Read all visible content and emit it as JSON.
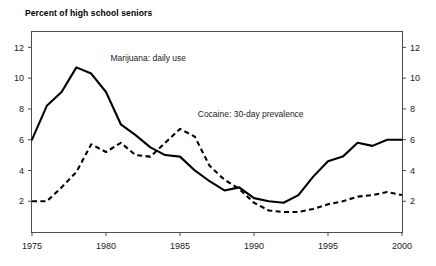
{
  "chart_data": {
    "type": "line",
    "title": "Percent of high school seniors",
    "xlabel": "",
    "ylabel": "",
    "xlim": [
      1975,
      2000
    ],
    "ylim": [
      0,
      13
    ],
    "grid": false,
    "legend_position": "inline-annotation",
    "x_ticks": [
      "1975",
      "1980",
      "1985",
      "1990",
      "1995",
      "2000"
    ],
    "x_tick_values": [
      1975,
      1980,
      1985,
      1990,
      1995,
      2000
    ],
    "y_ticks": [
      "2",
      "4",
      "6",
      "8",
      "10",
      "12"
    ],
    "y_tick_values": [
      2,
      4,
      6,
      8,
      10,
      12
    ],
    "y_ticks_right": [
      "2",
      "4",
      "6",
      "8",
      "10",
      "12"
    ],
    "x": [
      1975,
      1976,
      1977,
      1978,
      1979,
      1980,
      1981,
      1982,
      1983,
      1984,
      1985,
      1986,
      1987,
      1988,
      1989,
      1990,
      1991,
      1992,
      1993,
      1994,
      1995,
      1996,
      1997,
      1998,
      1999,
      2000
    ],
    "series": [
      {
        "name": "Marijuana: daily use",
        "style": "solid",
        "label_x": 1980.3,
        "label_y": 11.1,
        "values": [
          6.0,
          8.2,
          9.1,
          10.7,
          10.3,
          9.1,
          7.0,
          6.3,
          5.5,
          5.0,
          4.9,
          4.0,
          3.3,
          2.7,
          2.9,
          2.2,
          2.0,
          1.9,
          2.4,
          3.6,
          4.6,
          4.9,
          5.8,
          5.6,
          6.0,
          6.0
        ],
        "peak": {
          "year": 1978,
          "value": 10.7
        },
        "trough": {
          "year": 1992,
          "value": 1.9
        }
      },
      {
        "name": "Cocaine: 30-day prevalence",
        "style": "dashed",
        "label_x": 1986.2,
        "label_y": 7.5,
        "values": [
          2.0,
          2.0,
          2.9,
          3.9,
          5.7,
          5.2,
          5.8,
          5.0,
          4.9,
          5.8,
          6.7,
          6.2,
          4.3,
          3.4,
          2.8,
          1.9,
          1.4,
          1.3,
          1.3,
          1.5,
          1.8,
          2.0,
          2.3,
          2.4,
          2.6,
          2.4
        ],
        "peak": {
          "year": 1985,
          "value": 6.7
        },
        "trough": {
          "year": 1992,
          "value": 1.3
        }
      }
    ]
  }
}
